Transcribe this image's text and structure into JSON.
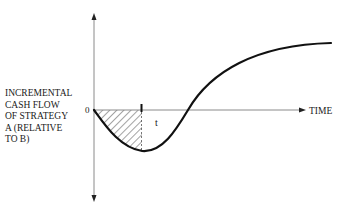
{
  "diagram": {
    "y_axis_label": "INCREMENTAL\nCASH FLOW\nOF STRATEGY\nA (RELATIVE\nTO B)",
    "x_axis_label": "TIME",
    "origin_label": "0",
    "t_label": "t",
    "colors": {
      "axis": "#8a8a8a",
      "curve": "#111111",
      "hatch": "#333333",
      "text": "#1a1a1a"
    }
  }
}
